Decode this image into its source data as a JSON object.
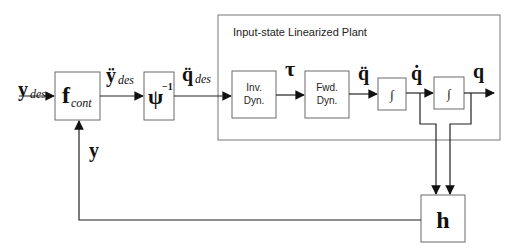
{
  "diagram": {
    "title": "Input-state Linearized Plant",
    "signals": {
      "y_des": {
        "main": "y",
        "sub": "des"
      },
      "ydd_des": {
        "main": "ÿ",
        "sub": "des"
      },
      "qdd_des": {
        "main": "q̈",
        "sub": "des"
      },
      "tau": "τ",
      "qdd": "q̈",
      "qd": "q̇",
      "q": "q",
      "y_feedback": "y"
    },
    "blocks": {
      "f_cont": {
        "main": "f",
        "sub": "cont"
      },
      "psi_inv": {
        "main": "ψ",
        "sup": "−1"
      },
      "inv_dyn": {
        "line1": "Inv.",
        "line2": "Dyn."
      },
      "fwd_dyn": {
        "line1": "Fwd.",
        "line2": "Dyn."
      },
      "integrator_1": "∫",
      "integrator_2": "∫",
      "h": "h"
    }
  }
}
